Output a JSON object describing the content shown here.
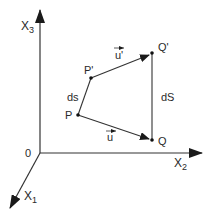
{
  "diagram": {
    "axes": {
      "x1": {
        "label": "X",
        "subscript": "1"
      },
      "x2": {
        "label": "X",
        "subscript": "2"
      },
      "x3": {
        "label": "X",
        "subscript": "3"
      },
      "origin": "0"
    },
    "points": {
      "P": "P",
      "P_prime": "P'",
      "Q": "Q",
      "Q_prime": "Q'"
    },
    "segments": {
      "ds": "ds",
      "dS": "dS"
    },
    "vectors": {
      "u": "u",
      "u_prime": "u'"
    },
    "colors": {
      "line": "#2a2a2a",
      "background": "#ffffff"
    }
  }
}
